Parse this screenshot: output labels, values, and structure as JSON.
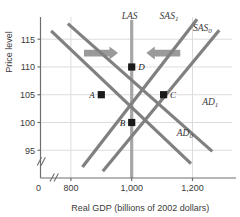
{
  "chart_data": {
    "type": "line",
    "title": "",
    "xlabel": "Real GDP (billions of 2002 dollars)",
    "ylabel": "Price level",
    "xlim": [
      700,
      1330
    ],
    "ylim": [
      90,
      119
    ],
    "grid": true,
    "legend_position": "inline-curve-labels",
    "xticks": [
      "0",
      "800",
      "1,000",
      "1,200"
    ],
    "yticks": [
      "115",
      "110",
      "105",
      "100",
      "95"
    ],
    "axis_breaks": {
      "x": "//",
      "y": "//"
    },
    "series": [
      {
        "name": "LAS",
        "label": "LAS",
        "sub": "",
        "type": "vertical",
        "x": 1000,
        "color": "#a6a6a6"
      },
      {
        "name": "SAS1",
        "label": "SAS",
        "sub": "1",
        "type": "upward",
        "color": "#808080",
        "points": [
          [
            838,
            92.0
          ],
          [
            1215,
            118.6
          ]
        ]
      },
      {
        "name": "SAS0",
        "label": "SAS",
        "sub": "0",
        "type": "upward",
        "color": "#808080",
        "points": [
          [
            905,
            91.2
          ],
          [
            1288,
            116.6
          ]
        ]
      },
      {
        "name": "AD1",
        "label": "AD",
        "sub": "1",
        "type": "downward",
        "color": "#808080",
        "points": [
          [
            790,
            117.8
          ],
          [
            1265,
            94.8
          ]
        ]
      },
      {
        "name": "AD0",
        "label": "AD",
        "sub": "0",
        "type": "downward",
        "color": "#808080",
        "points": [
          [
            735,
            116.5
          ],
          [
            1195,
            92.6
          ]
        ]
      }
    ],
    "points": [
      {
        "label": "A",
        "x": 900,
        "y": 105,
        "label_side": "left"
      },
      {
        "label": "B",
        "x": 1000,
        "y": 100,
        "label_side": "left"
      },
      {
        "label": "C",
        "x": 1105,
        "y": 105,
        "label_side": "right"
      },
      {
        "label": "D",
        "x": 1000,
        "y": 110,
        "label_side": "right"
      }
    ],
    "annotations": [
      {
        "name": "arrow-right",
        "direction": "right",
        "from_x": 843,
        "to_x": 955,
        "y": 112.5
      },
      {
        "name": "arrow-left",
        "direction": "left",
        "from_x": 1160,
        "to_x": 1048,
        "y": 112.5
      }
    ],
    "colors": {
      "curve": "#808080",
      "las": "#a6a6a6",
      "arrow": "#9a9a9a",
      "grid": "#dcdcdc",
      "axis": "#6e6e6e",
      "marker": "#1a1a1a",
      "text": "#3b3b3b"
    }
  }
}
